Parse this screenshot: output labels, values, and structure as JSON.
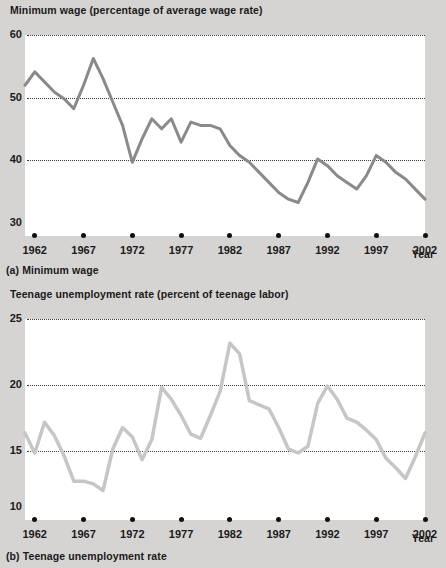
{
  "figure": {
    "panel_a": {
      "title": "Minimum wage (percentage of average wage rate)",
      "caption": "(a) Minimum wage",
      "x_axis_name": "Year"
    },
    "panel_b": {
      "title": "Teenage unemployment rate (percent of teenage labor)",
      "caption": "(b) Teenage unemployment rate",
      "x_axis_name": "Year"
    }
  },
  "colors": {
    "background": "#d6d4d2",
    "plot_background": "#ffffff",
    "series_a_line": "#8a8a8a",
    "series_b_line": "#c6c6c6",
    "gridline": "#3a3a3a",
    "text": "#1a1a1a"
  },
  "chart_data": [
    {
      "type": "line",
      "title": "Minimum wage (percentage of average wage rate)",
      "subtitle": "(a) Minimum wage",
      "xlabel": "Year",
      "ylabel": "Minimum wage (percentage of average wage rate)",
      "xlim": [
        1961,
        2002
      ],
      "ylim": [
        30,
        60
      ],
      "yticks": [
        30,
        40,
        50,
        60
      ],
      "xticks": [
        1962,
        1967,
        1972,
        1977,
        1982,
        1987,
        1992,
        1997,
        2002
      ],
      "grid": true,
      "legend": "none",
      "series": [
        {
          "name": "Minimum wage",
          "x": [
            1961,
            1962,
            1963,
            1964,
            1965,
            1966,
            1967,
            1968,
            1969,
            1970,
            1971,
            1972,
            1973,
            1974,
            1975,
            1976,
            1977,
            1978,
            1979,
            1980,
            1981,
            1982,
            1983,
            1984,
            1985,
            1986,
            1987,
            1988,
            1989,
            1990,
            1991,
            1992,
            1993,
            1994,
            1995,
            1996,
            1997,
            1998,
            1999,
            2000,
            2001,
            2002
          ],
          "values": [
            52.5,
            54.5,
            53.0,
            51.5,
            50.5,
            49.0,
            52.5,
            56.5,
            53.5,
            50.0,
            46.5,
            41.0,
            44.5,
            47.5,
            46.0,
            47.5,
            44.0,
            47.0,
            46.5,
            46.5,
            46.0,
            43.5,
            42.0,
            41.0,
            39.5,
            38.0,
            36.5,
            35.5,
            35.0,
            38.0,
            41.5,
            40.5,
            39.0,
            38.0,
            37.0,
            39.0,
            42.0,
            41.0,
            39.5,
            38.5,
            37.0,
            35.5
          ]
        }
      ]
    },
    {
      "type": "line",
      "title": "Teenage unemployment rate (percent of teenage labor)",
      "subtitle": "(b) Teenage unemployment rate",
      "xlabel": "Year",
      "ylabel": "Teenage unemployment rate (percent of teenage labor)",
      "xlim": [
        1961,
        2002
      ],
      "ylim": [
        10,
        25
      ],
      "yticks": [
        10,
        15,
        20,
        25
      ],
      "xticks": [
        1962,
        1967,
        1972,
        1977,
        1982,
        1987,
        1992,
        1997,
        2002
      ],
      "grid": true,
      "legend": "none",
      "series": [
        {
          "name": "Teenage unemployment rate",
          "x": [
            1961,
            1962,
            1963,
            1964,
            1965,
            1966,
            1967,
            1968,
            1969,
            1970,
            1971,
            1972,
            1973,
            1974,
            1975,
            1976,
            1977,
            1978,
            1979,
            1980,
            1981,
            1982,
            1983,
            1984,
            1985,
            1986,
            1987,
            1988,
            1989,
            1990,
            1991,
            1992,
            1993,
            1994,
            1995,
            1996,
            1997,
            1998,
            1999,
            2000,
            2001,
            2002
          ],
          "values": [
            16.5,
            15.0,
            17.3,
            16.3,
            14.8,
            12.9,
            12.9,
            12.7,
            12.2,
            15.3,
            16.9,
            16.2,
            14.5,
            16.0,
            19.9,
            19.0,
            17.8,
            16.4,
            16.1,
            17.8,
            19.6,
            23.2,
            22.4,
            18.9,
            18.6,
            18.3,
            16.9,
            15.3,
            15.0,
            15.5,
            18.7,
            20.0,
            19.0,
            17.6,
            17.3,
            16.7,
            16.0,
            14.6,
            13.9,
            13.1,
            14.7,
            16.5
          ]
        }
      ]
    }
  ]
}
